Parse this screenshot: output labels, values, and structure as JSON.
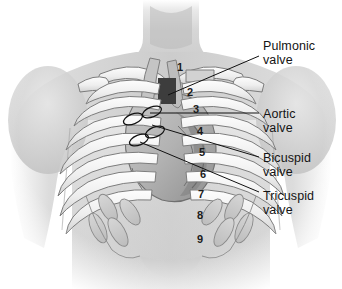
{
  "figure": {
    "background_color": "#ffffff",
    "text_color": "#141414"
  },
  "labels": [
    {
      "id": "pulmonic",
      "text": "Pulmonic\nvalve",
      "x": 263,
      "y": 40,
      "leader": {
        "x1": 259,
        "y1": 56,
        "x2": 168,
        "y2": 95
      }
    },
    {
      "id": "aortic",
      "text": "Aortic\nvalve",
      "x": 263,
      "y": 108,
      "leader": {
        "x1": 259,
        "y1": 113,
        "x2": 150,
        "y2": 113
      }
    },
    {
      "id": "bicuspid",
      "text": "Bicuspid\nvalve",
      "x": 263,
      "y": 152,
      "leader": {
        "x1": 259,
        "y1": 157,
        "x2": 152,
        "y2": 125
      }
    },
    {
      "id": "tricuspid",
      "text": "Tricuspid\nvalve",
      "x": 263,
      "y": 190,
      "leader": {
        "x1": 259,
        "y1": 192,
        "x2": 140,
        "y2": 142
      }
    }
  ],
  "rib_numbers": [
    {
      "n": "1",
      "x": 177,
      "y": 62
    },
    {
      "n": "2",
      "x": 187,
      "y": 87
    },
    {
      "n": "3",
      "x": 193,
      "y": 104
    },
    {
      "n": "4",
      "x": 197,
      "y": 126
    },
    {
      "n": "5",
      "x": 199,
      "y": 147
    },
    {
      "n": "6",
      "x": 200,
      "y": 169
    },
    {
      "n": "7",
      "x": 198,
      "y": 189
    },
    {
      "n": "8",
      "x": 197,
      "y": 210
    },
    {
      "n": "9",
      "x": 197,
      "y": 234
    }
  ],
  "valve_markers": [
    {
      "id": "pulmonic-marker",
      "cx": 133,
      "cy": 119,
      "rx": 10,
      "ry": 5,
      "rot": -22
    },
    {
      "id": "aortic-marker",
      "cx": 152,
      "cy": 112,
      "rx": 10,
      "ry": 5,
      "rot": -22
    },
    {
      "id": "bicuspid-marker",
      "cx": 155,
      "cy": 132,
      "rx": 10,
      "ry": 5,
      "rot": -22
    },
    {
      "id": "tricuspid-marker",
      "cx": 139,
      "cy": 140,
      "rx": 10,
      "ry": 5,
      "rot": -22
    }
  ],
  "anatomy": {
    "body": "torso",
    "parts": [
      "neck",
      "shoulders",
      "clavicles",
      "sternum",
      "rib-cage",
      "costal-cartilage",
      "heart",
      "great-vessels"
    ]
  }
}
